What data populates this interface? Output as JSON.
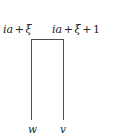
{
  "figure": {
    "type": "contour-diagram",
    "background_color": "#ffffff",
    "stroke_color": "#4d4d4d",
    "text_color": "#262626",
    "labels": {
      "top_left": {
        "text": "ia + ξ",
        "parts": {
          "var1": "ia",
          "op1": "+",
          "var2": "ξ"
        }
      },
      "top_right": {
        "text": "ia + ξ + 1",
        "parts": {
          "var1": "ia",
          "op1": "+",
          "var2": "ξ",
          "op2": "+",
          "num": "1"
        }
      },
      "bottom_left": {
        "text": "w"
      },
      "bottom_right": {
        "text": "v"
      }
    },
    "paths": {
      "top_bar": "horizontal segment joining the two vertical rays",
      "left_line": "vertical ray descending from ia+ξ to w",
      "right_line": "vertical ray descending from ia+ξ+1 to v"
    }
  }
}
